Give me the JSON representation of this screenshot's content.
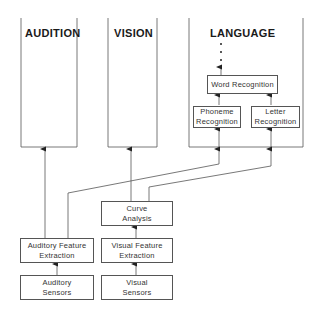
{
  "regions": {
    "audition": "AUDITION",
    "vision": "VISION",
    "language": "LANGUAGE"
  },
  "boxes": {
    "word_recognition": [
      "Word Recognition"
    ],
    "phoneme_recognition": [
      "Phoneme",
      "Recognition"
    ],
    "letter_recognition": [
      "Letter",
      "Recognition"
    ],
    "curve_analysis": [
      "Curve",
      "Analysis"
    ],
    "auditory_feature_extraction": [
      "Auditory Feature",
      "Extraction"
    ],
    "visual_feature_extraction": [
      "Visual Feature",
      "Extraction"
    ],
    "auditory_sensors": [
      "Auditory",
      "Sensors"
    ],
    "visual_sensors": [
      "Visual",
      "Sensors"
    ]
  },
  "colors": {
    "line": "#555555",
    "text": "#222222",
    "background": "#ffffff"
  }
}
